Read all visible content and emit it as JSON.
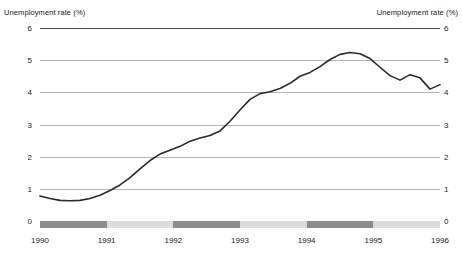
{
  "chart_data": {
    "type": "line",
    "title": "",
    "axis_title_left": "Unemployment rate (%)",
    "axis_title_right": "Unemployment rate (%)",
    "xlabel": "",
    "ylabel": "Unemployment rate (%)",
    "ylim": [
      0,
      6
    ],
    "xlim": [
      1990,
      1996
    ],
    "yticks": [
      0,
      1,
      2,
      3,
      4,
      5,
      6
    ],
    "ytick_labels": [
      "0",
      "1",
      "2",
      "3",
      "4",
      "5",
      "6"
    ],
    "xticks": [
      1990,
      1991,
      1992,
      1993,
      1994,
      1995,
      1996
    ],
    "xtick_labels": [
      "1990",
      "1991",
      "1992",
      "1993",
      "1994",
      "1995",
      "1996"
    ],
    "grid": true,
    "legend": "none",
    "line_color": "#2b2b2b",
    "grid_color": "#b5b5b5",
    "series": [
      {
        "name": "Unemployment rate",
        "x": [
          1990.0,
          1990.15,
          1990.3,
          1990.45,
          1990.6,
          1990.75,
          1990.9,
          1991.05,
          1991.2,
          1991.35,
          1991.5,
          1991.65,
          1991.8,
          1991.95,
          1992.1,
          1992.25,
          1992.4,
          1992.55,
          1992.7,
          1992.85,
          1993.0,
          1993.15,
          1993.3,
          1993.45,
          1993.6,
          1993.75,
          1993.9,
          1994.05,
          1994.2,
          1994.35,
          1994.5,
          1994.65,
          1994.8,
          1994.95,
          1995.1,
          1995.25,
          1995.4,
          1995.55,
          1995.7,
          1995.85,
          1996.0
        ],
        "y": [
          0.78,
          0.7,
          0.64,
          0.63,
          0.64,
          0.7,
          0.8,
          0.95,
          1.12,
          1.35,
          1.62,
          1.88,
          2.08,
          2.2,
          2.32,
          2.48,
          2.58,
          2.66,
          2.8,
          3.1,
          3.45,
          3.78,
          3.96,
          4.02,
          4.12,
          4.28,
          4.5,
          4.62,
          4.8,
          5.02,
          5.18,
          5.24,
          5.2,
          5.05,
          4.78,
          4.52,
          4.38,
          4.55,
          4.45,
          4.1,
          4.24
        ],
        "color": "#2b2b2b"
      }
    ],
    "bottom_band": {
      "segments": [
        {
          "from": 1990.0,
          "to": 1991.0,
          "shade": "dark",
          "color": "#8c8c8c"
        },
        {
          "from": 1991.0,
          "to": 1992.0,
          "shade": "light",
          "color": "#dcdcdc"
        },
        {
          "from": 1992.0,
          "to": 1993.0,
          "shade": "dark",
          "color": "#8c8c8c"
        },
        {
          "from": 1993.0,
          "to": 1994.0,
          "shade": "light",
          "color": "#dcdcdc"
        },
        {
          "from": 1994.0,
          "to": 1995.0,
          "shade": "dark",
          "color": "#8c8c8c"
        },
        {
          "from": 1995.0,
          "to": 1996.0,
          "shade": "light",
          "color": "#dcdcdc"
        }
      ]
    }
  }
}
